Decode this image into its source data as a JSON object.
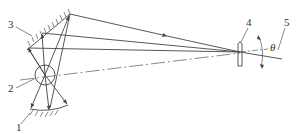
{
  "diagram": {
    "type": "optical schematic",
    "labels": {
      "item1": "1",
      "item2": "2",
      "item3": "3",
      "item4": "4",
      "item5": "5",
      "angle": "θ"
    },
    "components": [
      {
        "id": "1",
        "description": "lower curved reflecting surface (hatched)"
      },
      {
        "id": "2",
        "description": "circular element / rotation center"
      },
      {
        "id": "3",
        "description": "inclined flat mirror (hatched)"
      },
      {
        "id": "4",
        "description": "lens"
      },
      {
        "id": "5",
        "description": "tilted axis with angle theta"
      }
    ],
    "colors": {
      "line": "#444444",
      "background": "#ffffff"
    }
  }
}
